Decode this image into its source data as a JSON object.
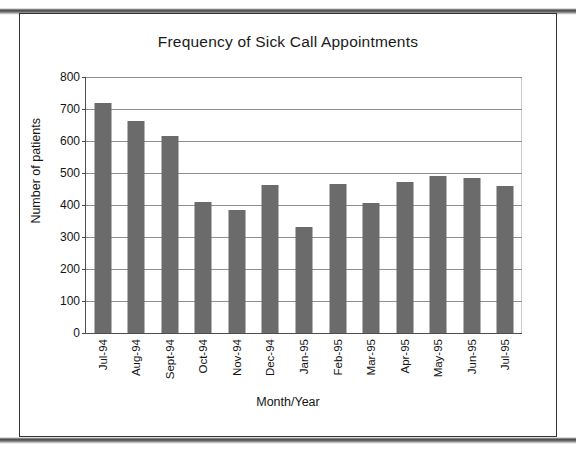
{
  "document": {
    "kind": "scanned-page-figure",
    "frame_color": "#333333"
  },
  "chart_data": {
    "type": "bar",
    "title": "Frequency of Sick Call Appointments",
    "xlabel": "Month/Year",
    "ylabel": "Number of patients",
    "categories": [
      "Jul-94",
      "Aug-94",
      "Sept-94",
      "Oct-94",
      "Nov-94",
      "Dec-94",
      "Jan-95",
      "Feb-95",
      "Mar-95",
      "Apr-95",
      "May-95",
      "Jun-95",
      "Jul-95"
    ],
    "values": [
      718,
      661,
      617,
      410,
      384,
      462,
      332,
      467,
      407,
      472,
      490,
      483,
      460
    ],
    "ylim": [
      0,
      800
    ],
    "ytick_step": 100,
    "yticks": [
      0,
      100,
      200,
      300,
      400,
      500,
      600,
      700,
      800
    ],
    "ytick_labels": [
      "0",
      "100",
      "200",
      "300",
      "400",
      "500",
      "600",
      "700",
      "800"
    ],
    "grid": true,
    "grid_axis": "y",
    "legend": false,
    "bar_color": "#6b6b6b",
    "grid_color": "#8e8e8e",
    "axis_color": "#4d4d4d"
  }
}
